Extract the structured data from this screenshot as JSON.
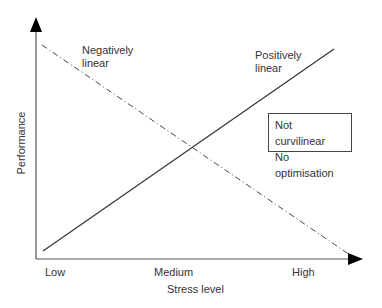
{
  "diagram": {
    "axes": {
      "x_label": "Stress level",
      "y_label": "Performance",
      "x_ticks": [
        "Low",
        "Medium",
        "High"
      ]
    },
    "lines": [
      {
        "name": "Negatively linear",
        "label_line1": "Negatively",
        "label_line2": "linear",
        "style": "dash-dot",
        "color": "#444444"
      },
      {
        "name": "Positively linear",
        "label_line1": "Positively",
        "label_line2": "linear",
        "style": "solid",
        "color": "#333333"
      }
    ],
    "legend_box": {
      "line1": "Not curvilinear",
      "line2": "No optimisation"
    }
  }
}
